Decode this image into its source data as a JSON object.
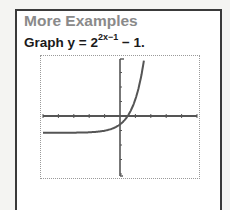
{
  "card": {
    "title": "More Examples",
    "prompt_prefix": "Graph y = 2",
    "prompt_exponent": "2x−1",
    "prompt_suffix": " − 1."
  },
  "chart_data": {
    "type": "line",
    "xlabel": "",
    "ylabel": "",
    "xlim": [
      -5,
      5
    ],
    "ylim": [
      -4,
      4
    ],
    "grid": false,
    "x_ticks": [
      -5,
      -4,
      -3,
      -2,
      -1,
      0,
      1,
      2,
      3,
      4,
      5
    ],
    "y_ticks": [
      -4,
      -3,
      -2,
      -1,
      0,
      1,
      2,
      3,
      4
    ],
    "series": [
      {
        "name": "y = 2^(2x-1) - 1",
        "x": [
          -5,
          -4,
          -3,
          -2,
          -1,
          -0.5,
          0,
          0.5,
          1,
          1.5,
          1.75,
          2,
          2.25
        ],
        "y": [
          -0.999,
          -0.998,
          -0.992,
          -0.969,
          -0.875,
          -0.75,
          -0.5,
          0,
          1,
          3,
          4.66,
          7,
          11.6
        ]
      }
    ],
    "colors": {
      "curve": "#555555",
      "axes": "#555555",
      "frame": "#9a9a9a"
    }
  }
}
